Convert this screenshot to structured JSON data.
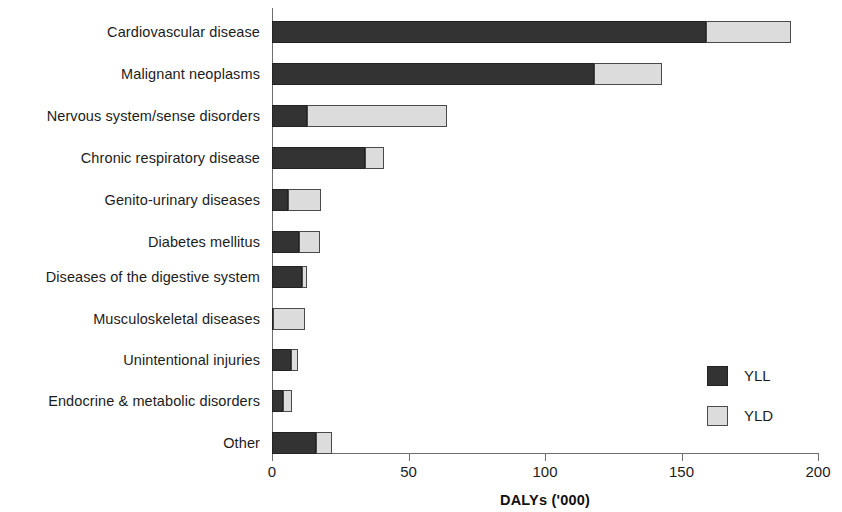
{
  "chart_data": {
    "type": "bar",
    "orientation": "horizontal",
    "stacked": true,
    "title": "",
    "xlabel": "DALYs ('000)",
    "ylabel": "",
    "xlim": [
      0,
      200
    ],
    "xticks": [
      0,
      50,
      100,
      150,
      200
    ],
    "xtick_labels": [
      "0",
      "50",
      "100",
      "150",
      "200"
    ],
    "grid": false,
    "legend_position": "inside-bottom-right",
    "categories": [
      "Cardiovascular disease",
      "Malignant neoplasms",
      "Nervous system/sense disorders",
      "Chronic respiratory disease",
      "Genito-urinary diseases",
      "Diabetes mellitus",
      "Diseases of the digestive system",
      "Musculoskeletal diseases",
      "Unintentional injuries",
      "Endocrine & metabolic disorders",
      "Other"
    ],
    "series": [
      {
        "name": "YLL",
        "color": "#333333",
        "values": [
          159,
          118,
          13,
          34,
          6,
          10,
          11,
          0.5,
          7,
          4,
          16
        ]
      },
      {
        "name": "YLD",
        "color": "#dcdcdc",
        "values": [
          31,
          25,
          51,
          7,
          12,
          7.5,
          2,
          11.5,
          2.5,
          3.5,
          6
        ]
      }
    ],
    "totals": [
      190,
      143,
      64,
      41,
      18,
      17.5,
      13,
      12,
      9.5,
      7.5,
      22
    ]
  },
  "legend": {
    "items": [
      {
        "label": "YLL",
        "swatch": "dark-square-swatch"
      },
      {
        "label": "YLD",
        "swatch": "light-square-swatch"
      }
    ]
  }
}
